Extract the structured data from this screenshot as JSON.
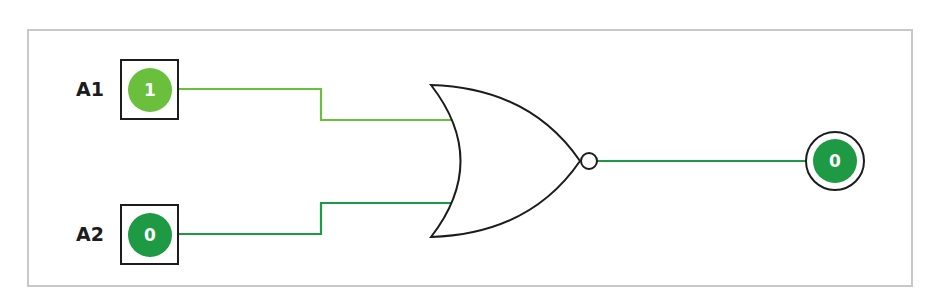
{
  "diagram": {
    "type": "logic-gate",
    "gate": "NOR",
    "inputs": [
      {
        "label": "A1",
        "value": "1",
        "color": "#6abf3c"
      },
      {
        "label": "A2",
        "value": "0",
        "color": "#1e9a45"
      }
    ],
    "output": {
      "value": "0",
      "color": "#1e9a45"
    },
    "colors": {
      "wire_high": "#6abf3c",
      "wire_low": "#1e9a45",
      "stroke": "#1c1c1c",
      "frame": "#c8c8c4"
    }
  }
}
